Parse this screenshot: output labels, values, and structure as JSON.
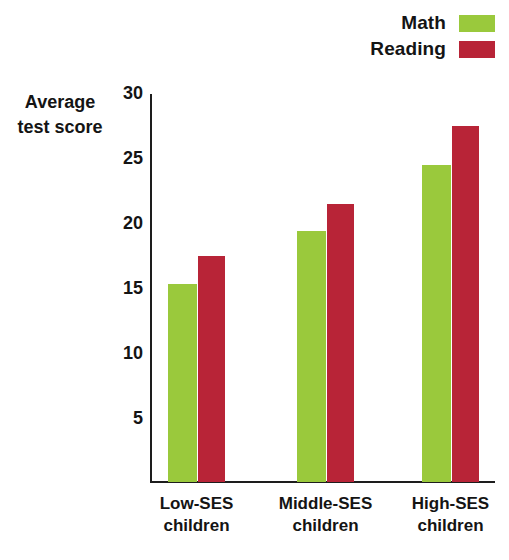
{
  "legend": {
    "position": "top-right",
    "entries": [
      {
        "label": "Math",
        "color": "#9AC93C",
        "icon": "legend-swatch-math"
      },
      {
        "label": "Reading",
        "color": "#B82437",
        "icon": "legend-swatch-reading"
      }
    ]
  },
  "axis_title": {
    "line1": "Average",
    "line2": "test score"
  },
  "chart_data": {
    "type": "bar",
    "title": "",
    "xlabel": "",
    "ylabel": "Average test score",
    "categories": [
      "Low-SES children",
      "Middle-SES children",
      "High-SES children"
    ],
    "category_lines": [
      [
        "Low-SES",
        "children"
      ],
      [
        "Middle-SES",
        "children"
      ],
      [
        "High-SES",
        "children"
      ]
    ],
    "series": [
      {
        "name": "Math",
        "color": "#9AC93C",
        "values": [
          15.2,
          19.3,
          24.4
        ]
      },
      {
        "name": "Reading",
        "color": "#B82437",
        "values": [
          17.4,
          21.4,
          27.4
        ]
      }
    ],
    "ylim": [
      0,
      30
    ],
    "yticks": [
      30,
      25,
      20,
      15,
      10,
      5
    ],
    "ytick_labels": [
      "30",
      "25",
      "20",
      "15",
      "10",
      "5"
    ],
    "grid": false,
    "legend_position": "top-right",
    "bar_gap": "grouped-adjacent"
  }
}
